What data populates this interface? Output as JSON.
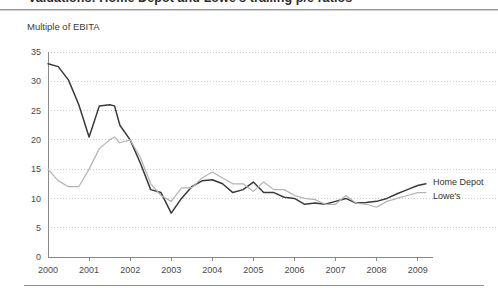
{
  "header": {
    "headline_clipped": "Valuations: Home Depot and Lowe's trailing p/e ratios"
  },
  "axis_caption": "Multiple of EBITA",
  "chart_data": {
    "type": "line",
    "title": "Multiple of EBITA",
    "xlabel": "",
    "ylabel": "Multiple of EBITA",
    "xlim": [
      2000,
      2009.3
    ],
    "ylim": [
      0,
      35
    ],
    "ytick_step": 5,
    "yticks": [
      0,
      5,
      10,
      15,
      20,
      25,
      30,
      35
    ],
    "xticks": [
      2000,
      2001,
      2002,
      2003,
      2004,
      2005,
      2006,
      2007,
      2008,
      2009
    ],
    "xtick_labels": [
      "2000",
      "2001",
      "2002",
      "2003",
      "2004",
      "2005",
      "2006",
      "2007",
      "2008",
      "2009"
    ],
    "grid": "horizontal-dotted",
    "legend_position": "right-inline-at-line-end",
    "colors": {
      "home_depot": "#3a3a3a",
      "lowes": "#b4b4b4",
      "gridline": "#bdbdbd",
      "axis": "#8a8a8a"
    },
    "series": [
      {
        "name": "Home Depot",
        "color": "#3a3a3a",
        "x": [
          2000.0,
          2000.25,
          2000.5,
          2000.75,
          2001.0,
          2001.12,
          2001.25,
          2001.5,
          2001.62,
          2001.75,
          2002.0,
          2002.25,
          2002.5,
          2002.75,
          2003.0,
          2003.25,
          2003.5,
          2003.75,
          2004.0,
          2004.25,
          2004.5,
          2004.75,
          2005.0,
          2005.25,
          2005.5,
          2005.75,
          2006.0,
          2006.25,
          2006.5,
          2006.75,
          2007.0,
          2007.25,
          2007.5,
          2007.75,
          2008.0,
          2008.25,
          2008.5,
          2008.75,
          2009.0,
          2009.2
        ],
        "values": [
          33.0,
          32.5,
          30.2,
          26.0,
          20.5,
          23.0,
          25.8,
          26.0,
          25.8,
          22.5,
          20.0,
          16.0,
          11.5,
          11.0,
          7.5,
          10.0,
          12.0,
          13.0,
          13.2,
          12.5,
          11.0,
          11.5,
          12.8,
          11.0,
          11.0,
          10.2,
          10.0,
          9.0,
          9.2,
          9.0,
          9.5,
          10.0,
          9.2,
          9.3,
          9.5,
          10.0,
          10.8,
          11.5,
          12.2,
          12.5
        ]
      },
      {
        "name": "Lowe's",
        "color": "#b4b4b4",
        "x": [
          2000.0,
          2000.25,
          2000.5,
          2000.75,
          2001.0,
          2001.25,
          2001.5,
          2001.62,
          2001.75,
          2002.0,
          2002.25,
          2002.5,
          2002.75,
          2003.0,
          2003.25,
          2003.5,
          2003.75,
          2004.0,
          2004.25,
          2004.5,
          2004.75,
          2005.0,
          2005.25,
          2005.5,
          2005.75,
          2006.0,
          2006.25,
          2006.5,
          2006.75,
          2007.0,
          2007.25,
          2007.5,
          2007.75,
          2008.0,
          2008.25,
          2008.5,
          2008.75,
          2009.0,
          2009.2
        ],
        "values": [
          15.0,
          13.0,
          12.0,
          12.0,
          15.0,
          18.5,
          20.0,
          20.5,
          19.5,
          20.0,
          17.0,
          12.5,
          10.5,
          9.5,
          11.8,
          11.8,
          13.5,
          14.5,
          13.5,
          12.5,
          12.5,
          11.2,
          12.8,
          11.5,
          11.5,
          10.5,
          10.0,
          9.8,
          9.0,
          9.0,
          10.5,
          9.2,
          9.0,
          8.5,
          9.5,
          10.0,
          10.5,
          11.0,
          11.0
        ]
      }
    ]
  },
  "legend": [
    {
      "label": "Home Depot",
      "color": "#3a3a3a"
    },
    {
      "label": "Lowe's",
      "color": "#b4b4b4"
    }
  ]
}
